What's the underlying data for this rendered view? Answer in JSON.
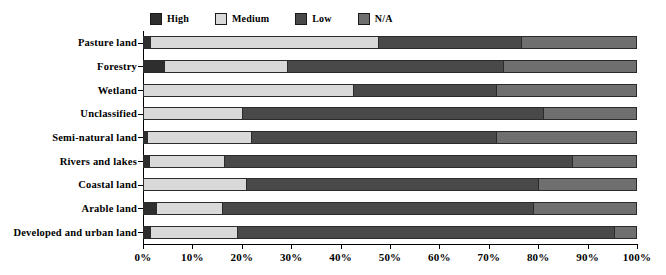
{
  "chart_data": {
    "type": "bar",
    "orientation": "horizontal",
    "stacked": true,
    "normalized_percent": true,
    "title": "",
    "xlabel": "",
    "ylabel": "",
    "xlim": [
      0,
      100
    ],
    "grid": false,
    "legend_position": "top-center",
    "xtick_labels": [
      "0%",
      "10%",
      "20%",
      "30%",
      "40%",
      "50%",
      "60%",
      "70%",
      "80%",
      "90%",
      "100%"
    ],
    "xtick_values": [
      0,
      10,
      20,
      30,
      40,
      50,
      60,
      70,
      80,
      90,
      100
    ],
    "categories": [
      "Pasture land",
      "Forestry",
      "Wetland",
      "Unclassified",
      "Semi-natural land",
      "Rivers and lakes",
      "Coastal land",
      "Arable land",
      "Developed and urban land"
    ],
    "series": [
      {
        "name": "High",
        "color": "#2e2e2e",
        "values": [
          1.2,
          4.0,
          0.0,
          0.0,
          0.6,
          1.0,
          0.0,
          2.4,
          1.2
        ]
      },
      {
        "name": "Medium",
        "color": "#d9d9d9",
        "values": [
          46.4,
          25.0,
          42.5,
          20.0,
          21.2,
          15.2,
          20.8,
          13.5,
          17.8
        ]
      },
      {
        "name": "Low",
        "color": "#494949",
        "values": [
          29.0,
          44.0,
          29.0,
          61.0,
          49.7,
          70.8,
          59.2,
          63.1,
          76.5
        ]
      },
      {
        "name": "N/A",
        "color": "#6f6f6f",
        "values": [
          23.4,
          27.0,
          28.5,
          19.0,
          28.5,
          13.0,
          20.0,
          21.0,
          4.5
        ]
      }
    ]
  },
  "legend": {
    "entries": [
      {
        "label": "High",
        "color": "#2e2e2e"
      },
      {
        "label": "Medium",
        "color": "#d9d9d9"
      },
      {
        "label": "Low",
        "color": "#494949"
      },
      {
        "label": "N/A",
        "color": "#6f6f6f"
      }
    ]
  }
}
